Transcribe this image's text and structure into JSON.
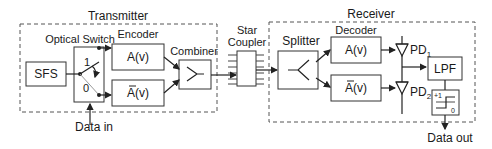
{
  "transmitter": {
    "title": "Transmitter",
    "sfs": "SFS",
    "optical_switch": "Optical Switch",
    "switch_1": "1",
    "switch_0": "0",
    "encoder": "Encoder",
    "enc_a": "A(v)",
    "enc_abar": "A(v)",
    "combiner": "Combiner",
    "data_in": "Data in"
  },
  "star_coupler": {
    "line1": "Star",
    "line2": "Coupler"
  },
  "receiver": {
    "title": "Receiver",
    "splitter": "Splitter",
    "decoder": "Decoder",
    "dec_a": "A(v)",
    "dec_abar": "A(v)",
    "pd1": "PD",
    "pd1_sub": "1",
    "pd2": "PD",
    "pd2_sub": "2",
    "lpf": "LPF",
    "thr_plus": "+1",
    "thr_zero": "0",
    "data_out": "Data out"
  }
}
